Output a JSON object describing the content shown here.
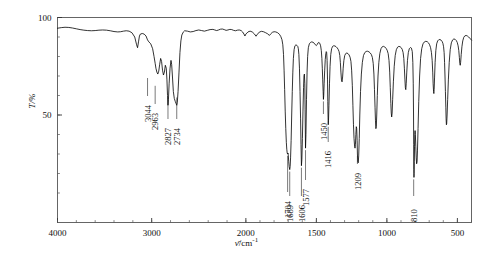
{
  "chart_data": {
    "type": "line",
    "title": "",
    "subtitle": "",
    "xlabel": "ν̄/cm⁻¹",
    "ylabel": "T/%",
    "xlabel_symbol": "ν̄",
    "xlabel_unit": "/cm",
    "xlabel_exponent": "-1",
    "ylabel_symbol": "T",
    "ylabel_unit": "/%",
    "xlim": [
      4000,
      400
    ],
    "ylim": [
      0,
      100
    ],
    "x_inverted": true,
    "x_piecewise_scale": "4000-2000 compressed, 2000-400 expanded",
    "grid": false,
    "legend": false,
    "legend_position": "none",
    "xticks": [
      4000,
      3000,
      2000,
      1500,
      1000,
      500
    ],
    "xtick_labels": [
      "4000",
      "3000",
      "2000",
      "1500",
      "1000",
      "500"
    ],
    "yticks": [
      50,
      100
    ],
    "ytick_labels": [
      "50",
      "100"
    ],
    "y_minor_tick_step": 10,
    "series_name": "transmittance",
    "line_color": "#000000",
    "line_width": 0.8,
    "frame_color": "#555555",
    "peak_labels": [
      {
        "wavenumber": 3044,
        "label": "3044",
        "transmittance": 70
      },
      {
        "wavenumber": 2963,
        "label": "2963",
        "transmittance": 66
      },
      {
        "wavenumber": 2827,
        "label": "2827",
        "transmittance": 60
      },
      {
        "wavenumber": 2734,
        "label": "2734",
        "transmittance": 60
      },
      {
        "wavenumber": 1704,
        "label": "1704",
        "transmittance": 30
      },
      {
        "wavenumber": 1689,
        "label": "1689",
        "transmittance": 22
      },
      {
        "wavenumber": 1606,
        "label": "1606",
        "transmittance": 24
      },
      {
        "wavenumber": 1577,
        "label": "1577",
        "transmittance": 33
      },
      {
        "wavenumber": 1450,
        "label": "1450",
        "transmittance": 58
      },
      {
        "wavenumber": 1416,
        "label": "1416",
        "transmittance": 45
      },
      {
        "wavenumber": 1209,
        "label": "1209",
        "transmittance": 30
      },
      {
        "wavenumber": 810,
        "label": "810",
        "transmittance": 18
      }
    ],
    "points": [
      [
        4000,
        94.5
      ],
      [
        3960,
        94.8
      ],
      [
        3920,
        95.0
      ],
      [
        3880,
        94.9
      ],
      [
        3840,
        94.6
      ],
      [
        3800,
        94.2
      ],
      [
        3760,
        93.8
      ],
      [
        3720,
        93.5
      ],
      [
        3680,
        93.3
      ],
      [
        3640,
        93.2
      ],
      [
        3600,
        93.3
      ],
      [
        3560,
        93.5
      ],
      [
        3520,
        93.6
      ],
      [
        3480,
        93.5
      ],
      [
        3440,
        93.2
      ],
      [
        3400,
        92.8
      ],
      [
        3360,
        92.6
      ],
      [
        3330,
        92.7
      ],
      [
        3300,
        93.0
      ],
      [
        3270,
        93.2
      ],
      [
        3240,
        93.0
      ],
      [
        3210,
        92.2
      ],
      [
        3180,
        90.0
      ],
      [
        3160,
        86.0
      ],
      [
        3150,
        84.5
      ],
      [
        3140,
        87.5
      ],
      [
        3130,
        90.5
      ],
      [
        3120,
        91.5
      ],
      [
        3100,
        91.8
      ],
      [
        3080,
        91.5
      ],
      [
        3060,
        90.5
      ],
      [
        3044,
        88.5
      ],
      [
        3030,
        87.5
      ],
      [
        3010,
        86.5
      ],
      [
        2990,
        84.0
      ],
      [
        2975,
        80.0
      ],
      [
        2963,
        76.5
      ],
      [
        2955,
        74.0
      ],
      [
        2945,
        72.0
      ],
      [
        2935,
        71.0
      ],
      [
        2925,
        72.5
      ],
      [
        2915,
        76.0
      ],
      [
        2905,
        79.0
      ],
      [
        2895,
        77.5
      ],
      [
        2885,
        73.0
      ],
      [
        2875,
        70.5
      ],
      [
        2865,
        72.0
      ],
      [
        2855,
        75.5
      ],
      [
        2845,
        74.0
      ],
      [
        2838,
        68.0
      ],
      [
        2832,
        60.0
      ],
      [
        2827,
        55.0
      ],
      [
        2822,
        58.0
      ],
      [
        2815,
        66.0
      ],
      [
        2805,
        74.0
      ],
      [
        2795,
        78.0
      ],
      [
        2788,
        76.0
      ],
      [
        2780,
        70.0
      ],
      [
        2770,
        62.0
      ],
      [
        2760,
        58.5
      ],
      [
        2750,
        57.0
      ],
      [
        2742,
        56.0
      ],
      [
        2734,
        55.0
      ],
      [
        2728,
        56.5
      ],
      [
        2720,
        62.0
      ],
      [
        2710,
        72.0
      ],
      [
        2700,
        82.0
      ],
      [
        2690,
        88.0
      ],
      [
        2680,
        91.0
      ],
      [
        2665,
        92.5
      ],
      [
        2650,
        93.2
      ],
      [
        2620,
        93.0
      ],
      [
        2590,
        92.6
      ],
      [
        2560,
        92.8
      ],
      [
        2530,
        93.3
      ],
      [
        2500,
        93.6
      ],
      [
        2470,
        93.3
      ],
      [
        2440,
        93.0
      ],
      [
        2410,
        93.4
      ],
      [
        2380,
        93.8
      ],
      [
        2350,
        93.9
      ],
      [
        2330,
        93.6
      ],
      [
        2310,
        93.3
      ],
      [
        2290,
        93.6
      ],
      [
        2270,
        94.0
      ],
      [
        2250,
        94.1
      ],
      [
        2230,
        93.8
      ],
      [
        2210,
        93.4
      ],
      [
        2190,
        93.6
      ],
      [
        2170,
        93.9
      ],
      [
        2150,
        93.8
      ],
      [
        2130,
        93.4
      ],
      [
        2110,
        93.2
      ],
      [
        2090,
        93.5
      ],
      [
        2070,
        93.6
      ],
      [
        2050,
        93.3
      ],
      [
        2035,
        92.6
      ],
      [
        2020,
        91.5
      ],
      [
        2010,
        90.5
      ],
      [
        2000,
        91.5
      ],
      [
        1985,
        92.6
      ],
      [
        1970,
        93.0
      ],
      [
        1955,
        92.6
      ],
      [
        1940,
        91.6
      ],
      [
        1928,
        90.4
      ],
      [
        1918,
        91.4
      ],
      [
        1905,
        92.5
      ],
      [
        1890,
        92.9
      ],
      [
        1875,
        92.7
      ],
      [
        1860,
        92.2
      ],
      [
        1845,
        91.6
      ],
      [
        1833,
        90.8
      ],
      [
        1824,
        91.6
      ],
      [
        1812,
        92.4
      ],
      [
        1800,
        92.7
      ],
      [
        1788,
        92.6
      ],
      [
        1775,
        92.2
      ],
      [
        1762,
        91.4
      ],
      [
        1752,
        90.2
      ],
      [
        1744,
        88.6
      ],
      [
        1738,
        86.0
      ],
      [
        1733,
        81.0
      ],
      [
        1729,
        73.0
      ],
      [
        1725,
        63.0
      ],
      [
        1721,
        52.0
      ],
      [
        1717,
        43.0
      ],
      [
        1713,
        36.0
      ],
      [
        1710,
        32.5
      ],
      [
        1707,
        30.5
      ],
      [
        1704,
        30.0
      ],
      [
        1701,
        30.5
      ],
      [
        1699,
        29.0
      ],
      [
        1696,
        26.0
      ],
      [
        1693,
        23.5
      ],
      [
        1689,
        22.0
      ],
      [
        1686,
        23.5
      ],
      [
        1683,
        28.0
      ],
      [
        1679,
        37.0
      ],
      [
        1675,
        50.0
      ],
      [
        1671,
        62.0
      ],
      [
        1667,
        72.0
      ],
      [
        1663,
        79.0
      ],
      [
        1658,
        83.5
      ],
      [
        1652,
        85.5
      ],
      [
        1645,
        86.0
      ],
      [
        1638,
        85.7
      ],
      [
        1632,
        85.2
      ],
      [
        1628,
        84.0
      ],
      [
        1624,
        81.0
      ],
      [
        1620,
        74.0
      ],
      [
        1616,
        62.0
      ],
      [
        1612,
        48.0
      ],
      [
        1609,
        35.0
      ],
      [
        1606,
        24.0
      ],
      [
        1603,
        27.0
      ],
      [
        1599,
        38.0
      ],
      [
        1595,
        52.0
      ],
      [
        1591,
        64.0
      ],
      [
        1588,
        70.0
      ],
      [
        1585,
        71.0
      ],
      [
        1582,
        66.0
      ],
      [
        1580,
        53.0
      ],
      [
        1577,
        33.0
      ],
      [
        1574,
        40.0
      ],
      [
        1570,
        58.0
      ],
      [
        1566,
        72.0
      ],
      [
        1562,
        80.0
      ],
      [
        1557,
        84.5
      ],
      [
        1550,
        86.5
      ],
      [
        1542,
        87.2
      ],
      [
        1533,
        87.5
      ],
      [
        1524,
        87.3
      ],
      [
        1515,
        86.8
      ],
      [
        1507,
        86.0
      ],
      [
        1500,
        85.6
      ],
      [
        1494,
        86.2
      ],
      [
        1488,
        87.0
      ],
      [
        1482,
        87.2
      ],
      [
        1476,
        86.8
      ],
      [
        1470,
        85.5
      ],
      [
        1465,
        83.0
      ],
      [
        1461,
        79.0
      ],
      [
        1458,
        74.0
      ],
      [
        1455,
        68.0
      ],
      [
        1452,
        62.0
      ],
      [
        1450,
        58.0
      ],
      [
        1448,
        60.0
      ],
      [
        1445,
        66.0
      ],
      [
        1441,
        73.0
      ],
      [
        1437,
        78.5
      ],
      [
        1433,
        81.5
      ],
      [
        1430,
        82.5
      ],
      [
        1427,
        82.0
      ],
      [
        1424,
        78.0
      ],
      [
        1421,
        68.0
      ],
      [
        1419,
        57.0
      ],
      [
        1417,
        48.5
      ],
      [
        1416,
        45.0
      ],
      [
        1414,
        47.0
      ],
      [
        1411,
        55.0
      ],
      [
        1407,
        66.0
      ],
      [
        1403,
        75.0
      ],
      [
        1398,
        81.0
      ],
      [
        1392,
        84.0
      ],
      [
        1385,
        85.2
      ],
      [
        1377,
        85.5
      ],
      [
        1368,
        85.4
      ],
      [
        1360,
        85.0
      ],
      [
        1352,
        84.4
      ],
      [
        1345,
        83.6
      ],
      [
        1339,
        82.5
      ],
      [
        1334,
        80.5
      ],
      [
        1330,
        77.0
      ],
      [
        1326,
        72.0
      ],
      [
        1322,
        68.0
      ],
      [
        1318,
        67.0
      ],
      [
        1314,
        69.5
      ],
      [
        1310,
        74.0
      ],
      [
        1305,
        78.0
      ],
      [
        1299,
        80.5
      ],
      [
        1292,
        81.5
      ],
      [
        1284,
        81.8
      ],
      [
        1276,
        81.5
      ],
      [
        1268,
        80.8
      ],
      [
        1261,
        79.6
      ],
      [
        1255,
        77.5
      ],
      [
        1250,
        73.0
      ],
      [
        1245,
        65.0
      ],
      [
        1241,
        55.0
      ],
      [
        1237,
        45.0
      ],
      [
        1233,
        38.0
      ],
      [
        1229,
        34.0
      ],
      [
        1226,
        33.0
      ],
      [
        1223,
        35.0
      ],
      [
        1220,
        40.0
      ],
      [
        1217,
        44.0
      ],
      [
        1214,
        43.0
      ],
      [
        1211,
        37.0
      ],
      [
        1209,
        30.0
      ],
      [
        1206,
        26.0
      ],
      [
        1203,
        25.5
      ],
      [
        1200,
        29.0
      ],
      [
        1196,
        38.0
      ],
      [
        1192,
        50.0
      ],
      [
        1187,
        62.0
      ],
      [
        1181,
        71.0
      ],
      [
        1174,
        77.0
      ],
      [
        1166,
        80.5
      ],
      [
        1157,
        82.0
      ],
      [
        1147,
        82.6
      ],
      [
        1137,
        82.7
      ],
      [
        1127,
        82.4
      ],
      [
        1118,
        81.8
      ],
      [
        1110,
        81.0
      ],
      [
        1103,
        79.5
      ],
      [
        1097,
        76.5
      ],
      [
        1092,
        71.0
      ],
      [
        1088,
        63.0
      ],
      [
        1084,
        54.0
      ],
      [
        1081,
        47.0
      ],
      [
        1078,
        43.0
      ],
      [
        1075,
        44.0
      ],
      [
        1072,
        50.0
      ],
      [
        1068,
        60.0
      ],
      [
        1063,
        70.0
      ],
      [
        1057,
        77.0
      ],
      [
        1050,
        81.5
      ],
      [
        1042,
        84.0
      ],
      [
        1033,
        85.0
      ],
      [
        1024,
        85.2
      ],
      [
        1015,
        84.9
      ],
      [
        1006,
        84.2
      ],
      [
        998,
        83.2
      ],
      [
        991,
        81.5
      ],
      [
        985,
        78.0
      ],
      [
        980,
        72.0
      ],
      [
        976,
        64.0
      ],
      [
        972,
        56.0
      ],
      [
        969,
        51.0
      ],
      [
        966,
        49.0
      ],
      [
        963,
        51.0
      ],
      [
        959,
        58.0
      ],
      [
        954,
        67.0
      ],
      [
        948,
        75.0
      ],
      [
        941,
        80.5
      ],
      [
        933,
        83.5
      ],
      [
        924,
        84.8
      ],
      [
        915,
        85.2
      ],
      [
        906,
        85.0
      ],
      [
        898,
        84.5
      ],
      [
        891,
        83.6
      ],
      [
        885,
        82.0
      ],
      [
        880,
        79.0
      ],
      [
        876,
        74.0
      ],
      [
        872,
        68.0
      ],
      [
        869,
        64.0
      ],
      [
        866,
        63.0
      ],
      [
        863,
        66.0
      ],
      [
        859,
        72.0
      ],
      [
        854,
        78.0
      ],
      [
        848,
        82.0
      ],
      [
        841,
        84.0
      ],
      [
        833,
        84.6
      ],
      [
        826,
        84.3
      ],
      [
        820,
        82.5
      ],
      [
        816,
        77.0
      ],
      [
        813,
        66.0
      ],
      [
        811,
        50.0
      ],
      [
        810,
        35.0
      ],
      [
        809,
        22.0
      ],
      [
        808,
        18.0
      ],
      [
        807,
        20.0
      ],
      [
        806,
        26.0
      ],
      [
        804,
        34.0
      ],
      [
        802,
        40.0
      ],
      [
        800,
        42.0
      ],
      [
        798,
        40.0
      ],
      [
        795,
        34.0
      ],
      [
        792,
        28.0
      ],
      [
        789,
        25.0
      ],
      [
        786,
        26.0
      ],
      [
        783,
        32.0
      ],
      [
        779,
        43.0
      ],
      [
        774,
        57.0
      ],
      [
        768,
        70.0
      ],
      [
        761,
        79.0
      ],
      [
        753,
        84.0
      ],
      [
        744,
        86.5
      ],
      [
        734,
        87.5
      ],
      [
        724,
        87.8
      ],
      [
        714,
        87.6
      ],
      [
        705,
        87.0
      ],
      [
        697,
        86.0
      ],
      [
        690,
        84.5
      ],
      [
        684,
        82.0
      ],
      [
        679,
        78.0
      ],
      [
        675,
        72.0
      ],
      [
        672,
        66.0
      ],
      [
        669,
        62.0
      ],
      [
        667,
        61.0
      ],
      [
        665,
        63.0
      ],
      [
        662,
        69.0
      ],
      [
        658,
        77.0
      ],
      [
        653,
        83.0
      ],
      [
        647,
        86.5
      ],
      [
        640,
        88.0
      ],
      [
        632,
        88.6
      ],
      [
        624,
        88.7
      ],
      [
        616,
        88.4
      ],
      [
        609,
        87.8
      ],
      [
        603,
        86.8
      ],
      [
        598,
        85.0
      ],
      [
        594,
        82.0
      ],
      [
        591,
        77.0
      ],
      [
        588,
        70.0
      ],
      [
        585,
        62.0
      ],
      [
        582,
        54.0
      ],
      [
        580,
        48.0
      ],
      [
        578,
        45.0
      ],
      [
        576,
        45.5
      ],
      [
        573,
        50.0
      ],
      [
        569,
        58.0
      ],
      [
        564,
        68.0
      ],
      [
        558,
        77.0
      ],
      [
        551,
        83.5
      ],
      [
        543,
        87.0
      ],
      [
        534,
        88.5
      ],
      [
        525,
        89.0
      ],
      [
        516,
        88.8
      ],
      [
        508,
        88.2
      ],
      [
        501,
        87.2
      ],
      [
        495,
        85.5
      ],
      [
        490,
        83.0
      ],
      [
        486,
        79.5
      ],
      [
        483,
        76.5
      ],
      [
        480,
        75.5
      ],
      [
        477,
        77.0
      ],
      [
        473,
        81.0
      ],
      [
        468,
        85.0
      ],
      [
        462,
        88.0
      ],
      [
        455,
        89.8
      ],
      [
        447,
        90.6
      ],
      [
        438,
        90.8
      ],
      [
        429,
        90.5
      ],
      [
        420,
        90.0
      ],
      [
        412,
        89.4
      ],
      [
        405,
        88.8
      ],
      [
        400,
        88.4
      ]
    ]
  }
}
